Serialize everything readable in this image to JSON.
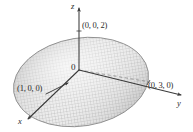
{
  "figure": {
    "kind": "3d-ellipsoid-plot",
    "background_color": "#ffffff",
    "line_color": "#3a3a3a",
    "surface_fill_light": "#e7e7e7",
    "surface_fill_dark": "#b8b8b8",
    "surface_mesh_color": "#9a9a9a",
    "surface_outline_color": "#8d8d8d",
    "axes": [
      {
        "id": "z",
        "label": "z",
        "direction": "up"
      },
      {
        "id": "y",
        "label": "y",
        "direction": "right"
      },
      {
        "id": "x",
        "label": "x",
        "direction": "down-left"
      }
    ],
    "origin_label": "0",
    "intercepts": [
      {
        "id": "z-intercept",
        "label": "(0, 0, 2)"
      },
      {
        "id": "y-intercept",
        "label": "(0, 3, 0)"
      },
      {
        "id": "x-intercept",
        "label": "(1, 0, 0)"
      }
    ]
  }
}
